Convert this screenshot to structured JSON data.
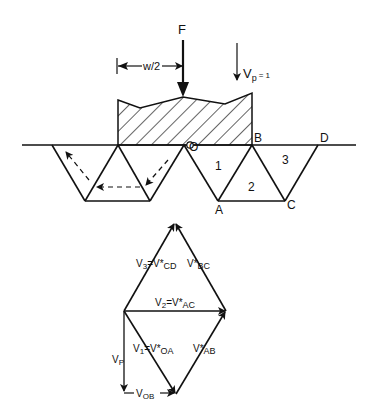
{
  "diagram": {
    "type": "upper-bound mechanism with velocity hodograph",
    "colors": {
      "line": "#111111",
      "background": "#ffffff"
    },
    "load": {
      "force_label": "F",
      "half_width_label": "w/2",
      "velocity_label_main": "V",
      "velocity_label_sub": "p",
      "velocity_label_value": "= 1"
    },
    "points": {
      "O": "O",
      "A": "A",
      "B": "B",
      "C": "C",
      "D": "D"
    },
    "blocks": [
      "1",
      "2",
      "3"
    ],
    "hodograph": {
      "v3": {
        "main": "V",
        "sub": "3",
        "eq": "=V*",
        "tail": "CD"
      },
      "vbc": {
        "main": "V*",
        "tail": "BC"
      },
      "v2": {
        "main": "V",
        "sub": "2",
        "eq": "=V*",
        "tail": "AC"
      },
      "v1": {
        "main": "V",
        "sub": "1",
        "eq": "=V*",
        "tail": "OA"
      },
      "vab": {
        "main": "V*",
        "tail": "AB"
      },
      "vp": {
        "main": "V",
        "sub": "P"
      },
      "vob": {
        "main": "V",
        "sub": "OB"
      }
    }
  }
}
